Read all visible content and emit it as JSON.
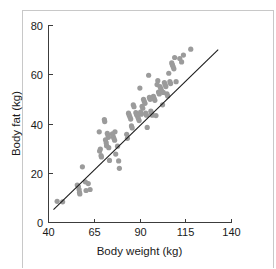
{
  "chart_data": {
    "type": "scatter",
    "title": "",
    "xlabel": "Body weight (kg)",
    "ylabel": "Body fat (kg)",
    "xlim": [
      40,
      140
    ],
    "ylim": [
      0,
      80
    ],
    "xticks": [
      40,
      65,
      90,
      115,
      140
    ],
    "yticks": [
      0,
      20,
      40,
      60,
      80
    ],
    "xtick_labels": [
      "40",
      "65",
      "90",
      "115",
      "140"
    ],
    "ytick_labels": [
      "0",
      "20",
      "40",
      "60",
      "80"
    ],
    "grid": false,
    "legend": null,
    "marker_color": "#9b9b9b",
    "line_color": "#1a1a1a",
    "axis_color": "#3c3c3c",
    "series": [
      {
        "name": "observations",
        "marker": "circle",
        "points": [
          [
            45.0,
            8.4
          ],
          [
            48.0,
            8.2
          ],
          [
            56.0,
            15.0
          ],
          [
            56.6,
            14.4
          ],
          [
            57.0,
            13.2
          ],
          [
            57.2,
            12.0
          ],
          [
            57.4,
            11.4
          ],
          [
            58.8,
            22.4
          ],
          [
            60.4,
            16.3
          ],
          [
            60.8,
            12.8
          ],
          [
            62.0,
            15.6
          ],
          [
            63.0,
            13.2
          ],
          [
            68.0,
            36.6
          ],
          [
            68.2,
            28.8
          ],
          [
            68.6,
            29.6
          ],
          [
            69.0,
            27.0
          ],
          [
            69.2,
            26.4
          ],
          [
            70.8,
            41.6
          ],
          [
            71.0,
            40.8
          ],
          [
            71.4,
            33.4
          ],
          [
            71.8,
            32.2
          ],
          [
            72.0,
            31.0
          ],
          [
            72.4,
            36.0
          ],
          [
            72.8,
            35.2
          ],
          [
            73.0,
            34.4
          ],
          [
            73.2,
            30.2
          ],
          [
            73.6,
            25.0
          ],
          [
            75.2,
            35.8
          ],
          [
            75.6,
            34.8
          ],
          [
            76.0,
            34.0
          ],
          [
            76.4,
            33.2
          ],
          [
            76.6,
            36.6
          ],
          [
            77.0,
            27.6
          ],
          [
            78.0,
            30.8
          ],
          [
            78.6,
            24.8
          ],
          [
            79.0,
            21.8
          ],
          [
            83.0,
            35.6
          ],
          [
            83.4,
            34.0
          ],
          [
            84.0,
            44.2
          ],
          [
            84.4,
            43.4
          ],
          [
            84.8,
            42.6
          ],
          [
            85.2,
            41.8
          ],
          [
            85.6,
            39.0
          ],
          [
            86.0,
            38.2
          ],
          [
            86.6,
            47.6
          ],
          [
            87.0,
            46.8
          ],
          [
            88.0,
            44.4
          ],
          [
            88.4,
            43.6
          ],
          [
            89.0,
            42.8
          ],
          [
            89.4,
            42.0
          ],
          [
            89.8,
            41.2
          ],
          [
            90.2,
            54.4
          ],
          [
            90.6,
            44.6
          ],
          [
            91.0,
            43.8
          ],
          [
            91.4,
            47.0
          ],
          [
            91.8,
            46.2
          ],
          [
            92.2,
            49.8
          ],
          [
            92.6,
            49.0
          ],
          [
            93.0,
            48.2
          ],
          [
            93.4,
            44.2
          ],
          [
            93.8,
            43.4
          ],
          [
            94.2,
            38.4
          ],
          [
            95.0,
            59.6
          ],
          [
            95.4,
            50.6
          ],
          [
            95.8,
            49.8
          ],
          [
            96.2,
            45.0
          ],
          [
            96.6,
            44.2
          ],
          [
            97.0,
            43.4
          ],
          [
            97.6,
            51.0
          ],
          [
            98.0,
            50.2
          ],
          [
            98.4,
            49.4
          ],
          [
            99.0,
            43.2
          ],
          [
            99.6,
            55.8
          ],
          [
            100.0,
            57.4
          ],
          [
            100.4,
            52.8
          ],
          [
            100.8,
            52.0
          ],
          [
            101.2,
            55.0
          ],
          [
            101.6,
            54.2
          ],
          [
            102.0,
            53.4
          ],
          [
            102.6,
            47.6
          ],
          [
            103.0,
            52.6
          ],
          [
            103.6,
            56.6
          ],
          [
            104.0,
            55.8
          ],
          [
            104.4,
            55.0
          ],
          [
            105.0,
            52.0
          ],
          [
            105.4,
            51.2
          ],
          [
            106.0,
            60.4
          ],
          [
            106.6,
            57.0
          ],
          [
            107.0,
            56.2
          ],
          [
            107.6,
            64.6
          ],
          [
            108.0,
            63.8
          ],
          [
            108.4,
            63.0
          ],
          [
            108.8,
            62.2
          ],
          [
            109.2,
            66.8
          ],
          [
            110.0,
            57.0
          ],
          [
            112.0,
            66.4
          ],
          [
            113.0,
            65.0
          ],
          [
            114.0,
            67.8
          ],
          [
            118.0,
            70.2
          ]
        ]
      }
    ],
    "fit_line": {
      "name": "least-squares fit",
      "x_start": 43.0,
      "y_start": 5.0,
      "x_end": 133.0,
      "y_end": 70.0
    }
  }
}
